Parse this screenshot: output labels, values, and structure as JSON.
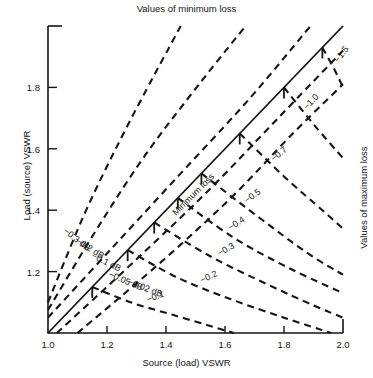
{
  "chart_data": {
    "type": "line",
    "title": "Values of minimum loss",
    "right_title": "Values of maximum loss",
    "xlabel": "Source (load) VSWR",
    "ylabel": "Load (source) VSWR",
    "xlim": [
      1.0,
      2.0
    ],
    "ylim": [
      1.0,
      2.0
    ],
    "xticks": [
      "1.0",
      "1.2",
      "1.4",
      "1.6",
      "1.8",
      "2.0"
    ],
    "xtick_values": [
      1.0,
      1.2,
      1.4,
      1.6,
      1.8,
      2.0
    ],
    "yticks": [
      "1.0",
      "1.2",
      "1.4",
      "1.6",
      "1.8"
    ],
    "ytick_values": [
      1.0,
      1.2,
      1.4,
      1.6,
      1.8
    ],
    "grid": false,
    "legend": "none",
    "diagonal_label": "Minimum loss",
    "series": [
      {
        "name": "-0.3 dB",
        "label": "−0.3 dB",
        "region": "upper",
        "style": "dashed",
        "points": [
          [
            1.0,
            1.1
          ],
          [
            1.12,
            1.38
          ],
          [
            1.24,
            1.62
          ],
          [
            1.36,
            1.84
          ],
          [
            1.45,
            2.0
          ]
        ]
      },
      {
        "name": "-0.2 dB",
        "label": "−0.2 dB",
        "region": "upper",
        "style": "dashed",
        "points": [
          [
            1.0,
            1.075
          ],
          [
            1.16,
            1.33
          ],
          [
            1.33,
            1.58
          ],
          [
            1.52,
            1.82
          ],
          [
            1.67,
            2.0
          ]
        ]
      },
      {
        "name": "-0.1 dB",
        "label": "−0.1 dB",
        "region": "upper",
        "style": "dashed",
        "points": [
          [
            1.0,
            1.05
          ],
          [
            1.22,
            1.28
          ],
          [
            1.45,
            1.52
          ],
          [
            1.68,
            1.76
          ],
          [
            1.89,
            2.0
          ]
        ]
      },
      {
        "name": "-0.05 dB",
        "label": "−0.05 dB",
        "region": "upper",
        "style": "dashed",
        "points": [
          [
            1.03,
            1.0
          ],
          [
            1.3,
            1.24
          ],
          [
            1.55,
            1.47
          ],
          [
            1.78,
            1.7
          ],
          [
            2.0,
            1.92
          ]
        ]
      },
      {
        "name": "-0.02 dB",
        "label": "−0.02 dB",
        "region": "upper",
        "style": "dashed",
        "points": [
          [
            1.1,
            1.0
          ],
          [
            1.37,
            1.22
          ],
          [
            1.62,
            1.44
          ],
          [
            1.83,
            1.65
          ],
          [
            2.0,
            1.81
          ]
        ]
      },
      {
        "name": "-0.1",
        "label": "−0.1",
        "region": "lower",
        "style": "dashed",
        "origin": [
          1.15,
          1.15
        ],
        "points": [
          [
            1.15,
            1.15
          ],
          [
            1.28,
            1.1
          ],
          [
            1.42,
            1.06
          ],
          [
            1.56,
            1.02
          ],
          [
            1.63,
            1.0
          ]
        ]
      },
      {
        "name": "-0.2",
        "label": "−0.2",
        "region": "lower",
        "style": "dashed",
        "origin": [
          1.27,
          1.27
        ],
        "points": [
          [
            1.27,
            1.27
          ],
          [
            1.44,
            1.18
          ],
          [
            1.62,
            1.11
          ],
          [
            1.8,
            1.05
          ],
          [
            1.96,
            1.0
          ]
        ]
      },
      {
        "name": "-0.3",
        "label": "−0.3",
        "region": "lower",
        "style": "dashed",
        "origin": [
          1.36,
          1.36
        ],
        "points": [
          [
            1.36,
            1.36
          ],
          [
            1.55,
            1.25
          ],
          [
            1.74,
            1.16
          ],
          [
            1.9,
            1.09
          ],
          [
            2.0,
            1.05
          ]
        ]
      },
      {
        "name": "-0.4",
        "label": "−0.4",
        "region": "lower",
        "style": "dashed",
        "origin": [
          1.44,
          1.44
        ],
        "points": [
          [
            1.44,
            1.44
          ],
          [
            1.63,
            1.31
          ],
          [
            1.82,
            1.21
          ],
          [
            2.0,
            1.13
          ]
        ]
      },
      {
        "name": "-0.5",
        "label": "−0.5",
        "region": "lower",
        "style": "dashed",
        "origin": [
          1.52,
          1.52
        ],
        "points": [
          [
            1.52,
            1.52
          ],
          [
            1.71,
            1.38
          ],
          [
            1.88,
            1.26
          ],
          [
            2.0,
            1.19
          ]
        ]
      },
      {
        "name": "-0.7",
        "label": "−0.7",
        "region": "lower",
        "style": "dashed",
        "origin": [
          1.65,
          1.65
        ],
        "points": [
          [
            1.65,
            1.65
          ],
          [
            1.8,
            1.51
          ],
          [
            1.93,
            1.4
          ],
          [
            2.0,
            1.34
          ]
        ]
      },
      {
        "name": "-1.0",
        "label": "−1.0",
        "region": "lower",
        "style": "dashed",
        "origin": [
          1.8,
          1.8
        ],
        "points": [
          [
            1.8,
            1.8
          ],
          [
            1.9,
            1.68
          ],
          [
            2.0,
            1.57
          ]
        ]
      },
      {
        "name": "-1.5",
        "label": "−1.5",
        "region": "lower",
        "style": "dashed",
        "origin": [
          1.93,
          1.93
        ],
        "points": [
          [
            1.93,
            1.93
          ],
          [
            1.97,
            1.86
          ],
          [
            2.0,
            1.8
          ]
        ]
      }
    ]
  },
  "axes": {
    "title": "Values of minimum loss",
    "right_title": "Values of maximum loss",
    "x_label": "Source (load) VSWR",
    "y_label": "Load (source) VSWR",
    "x_ticks": [
      "1.0",
      "1.2",
      "1.4",
      "1.6",
      "1.8",
      "2.0"
    ],
    "y_ticks": [
      "1.2",
      "1.4",
      "1.6",
      "1.8"
    ]
  },
  "annotations": {
    "diagonal": "Minimum loss",
    "upper": [
      "−0.3 dB",
      "−0.2 dB",
      "−0.1 dB",
      "−0.05 dB",
      "−0.02 dB"
    ],
    "lower": [
      "−0.1",
      "−0.2",
      "−0.3",
      "−0.4",
      "−0.5",
      "−0.7",
      "−1.0",
      "−1.5"
    ]
  },
  "colors": {
    "line": "#151515",
    "axis": "#151515",
    "background": "#ffffff"
  }
}
